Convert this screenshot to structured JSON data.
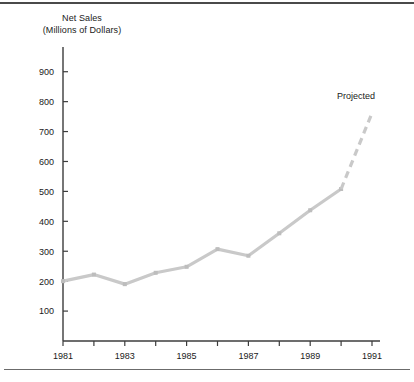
{
  "figure": {
    "name": "net-sales-line-chart",
    "background": "#ffffff",
    "rule_color": "#4a4a4a",
    "title_line_1": "Net Sales",
    "title_line_2": "(Millions of Dollars)",
    "annotation": "Projected"
  },
  "chart_data": {
    "type": "line",
    "title": "Net Sales (Millions of Dollars)",
    "xlabel": "",
    "ylabel": "Net Sales (Millions of Dollars)",
    "x": [
      1981,
      1982,
      1983,
      1984,
      1985,
      1986,
      1987,
      1988,
      1989,
      1990,
      1991
    ],
    "xtick_labels": [
      "1981",
      "",
      "1983",
      "",
      "1985",
      "",
      "1987",
      "",
      "1989",
      "",
      "1991"
    ],
    "xtick_labels_all": [
      "1981",
      "1982",
      "1983",
      "1984",
      "1985",
      "1986",
      "1987",
      "1988",
      "1989",
      "1990",
      "1991"
    ],
    "ytick_labels": [
      "100",
      "200",
      "300",
      "400",
      "500",
      "600",
      "700",
      "800",
      "900"
    ],
    "ytick_values": [
      100,
      200,
      300,
      400,
      500,
      600,
      700,
      800,
      900
    ],
    "xlim": [
      1981,
      1991
    ],
    "ylim": [
      0,
      960
    ],
    "grid": false,
    "legend": false,
    "series": [
      {
        "name": "Net Sales (actual)",
        "style": "solid",
        "color": "#c9c9c9",
        "markers": true,
        "x": [
          1981,
          1982,
          1983,
          1984,
          1985,
          1986,
          1987,
          1988,
          1989,
          1990
        ],
        "values": [
          200,
          222,
          190,
          228,
          248,
          307,
          285,
          360,
          437,
          508
        ]
      },
      {
        "name": "Net Sales (projected)",
        "style": "dashed",
        "color": "#c9c9c9",
        "markers": false,
        "x": [
          1990,
          1991
        ],
        "values": [
          508,
          762
        ]
      }
    ],
    "annotations": [
      {
        "text": "Projected",
        "x": 1991,
        "y": 830
      }
    ]
  }
}
